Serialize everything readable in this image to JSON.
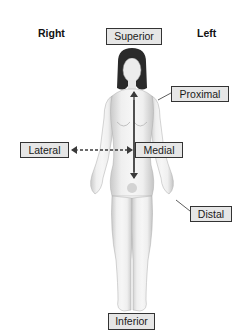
{
  "orientation": {
    "right_label": "Right",
    "left_label": "Left"
  },
  "terms": {
    "superior": "Superior",
    "inferior": "Inferior",
    "proximal": "Proximal",
    "distal": "Distal",
    "lateral": "Lateral",
    "medial": "Medial"
  },
  "colors": {
    "box_fill": "#e6e6e6",
    "box_border": "#333333",
    "arrow": "#444444",
    "skin_light": "#f2f2f2",
    "skin_shade": "#c8c8c8",
    "hair": "#2a2a2a"
  }
}
